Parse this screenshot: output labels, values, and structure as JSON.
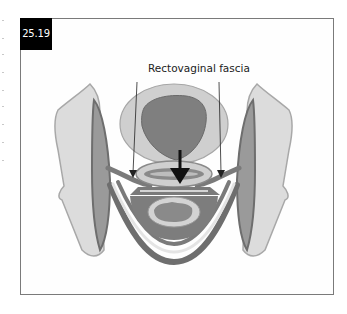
{
  "figure": {
    "number": "25.19",
    "label": "Rectovaginal fascia",
    "colors": {
      "frame_border": "#7a7a7a",
      "badge_bg": "#000000",
      "badge_text": "#ffffff",
      "bone_fill": "#d9d9d9",
      "bone_edge": "#a8a8a8",
      "muscle_dark": "#6e6e6e",
      "muscle_mid": "#8f8f8f",
      "organ_light": "#c9c9c9",
      "organ_dark": "#7d7d7d",
      "arrow": "#111111"
    },
    "structures": [
      {
        "id": "left-pelvic-bone"
      },
      {
        "id": "right-pelvic-bone"
      },
      {
        "id": "bladder"
      },
      {
        "id": "vagina"
      },
      {
        "id": "rectovaginal-septum"
      },
      {
        "id": "rectum"
      },
      {
        "id": "levator-sling"
      }
    ],
    "arrows": [
      {
        "id": "left-label-arrow",
        "type": "thin"
      },
      {
        "id": "right-label-arrow",
        "type": "thin"
      },
      {
        "id": "center-force-arrow",
        "type": "bold"
      }
    ]
  }
}
